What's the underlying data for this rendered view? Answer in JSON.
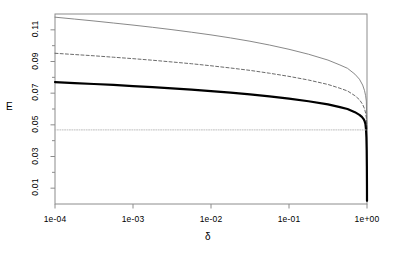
{
  "chart_data": {
    "type": "line",
    "title": "",
    "xlabel": "δ",
    "ylabel": "E",
    "xscale": "log",
    "xlim": [
      0.0001,
      1.0
    ],
    "ylim": [
      0.0,
      0.12
    ],
    "grid": false,
    "legend": "none",
    "xticks": [
      {
        "value": 0.0001,
        "label": "1e-04"
      },
      {
        "value": 0.001,
        "label": "1e-03"
      },
      {
        "value": 0.01,
        "label": "1e-02"
      },
      {
        "value": 0.1,
        "label": "1e-01"
      },
      {
        "value": 1.0,
        "label": "1e+00"
      }
    ],
    "yticks": [
      {
        "value": 0.01,
        "label": "0.01"
      },
      {
        "value": 0.03,
        "label": "0.03"
      },
      {
        "value": 0.05,
        "label": "0.05"
      },
      {
        "value": 0.07,
        "label": "0.07"
      },
      {
        "value": 0.09,
        "label": "0.09"
      },
      {
        "value": 0.11,
        "label": "0.11"
      }
    ],
    "yminorticks": [
      0.02,
      0.04,
      0.06,
      0.08,
      0.1
    ],
    "series": [
      {
        "name": "upper-thin-solid",
        "style": "solid",
        "color": "#7a7a7a",
        "width": 0.9,
        "x": [
          0.0001,
          0.000178,
          0.000316,
          0.000562,
          0.001,
          0.00178,
          0.00316,
          0.00562,
          0.01,
          0.0178,
          0.0316,
          0.0562,
          0.1,
          0.178,
          0.316,
          0.45,
          0.562,
          0.7,
          0.8,
          0.88,
          0.93,
          0.96,
          0.98,
          1.0
        ],
        "y": [
          0.118,
          0.1168,
          0.1156,
          0.1143,
          0.113,
          0.1116,
          0.1101,
          0.1085,
          0.1068,
          0.1049,
          0.1028,
          0.1004,
          0.0977,
          0.0946,
          0.0909,
          0.0878,
          0.0857,
          0.082,
          0.0788,
          0.0751,
          0.0716,
          0.0684,
          0.065,
          0.047
        ]
      },
      {
        "name": "middle-dashed",
        "style": "dashed",
        "color": "#5a5a5a",
        "width": 0.9,
        "x": [
          0.0001,
          0.000178,
          0.000316,
          0.000562,
          0.001,
          0.00178,
          0.00316,
          0.00562,
          0.01,
          0.0178,
          0.0316,
          0.0562,
          0.1,
          0.178,
          0.316,
          0.45,
          0.562,
          0.7,
          0.8,
          0.88,
          0.93,
          0.96,
          0.98,
          1.0
        ],
        "y": [
          0.0952,
          0.0944,
          0.0936,
          0.0927,
          0.0918,
          0.0908,
          0.0897,
          0.0886,
          0.0873,
          0.0859,
          0.0844,
          0.0826,
          0.0806,
          0.0783,
          0.0755,
          0.0731,
          0.0714,
          0.0684,
          0.0659,
          0.0629,
          0.0601,
          0.0574,
          0.0545,
          0.047
        ]
      },
      {
        "name": "lower-thick-solid",
        "style": "solid",
        "color": "#000000",
        "width": 2.2,
        "x": [
          0.0001,
          0.000178,
          0.000316,
          0.000562,
          0.001,
          0.00178,
          0.00316,
          0.00562,
          0.01,
          0.0178,
          0.0316,
          0.0562,
          0.1,
          0.178,
          0.316,
          0.45,
          0.562,
          0.7,
          0.8,
          0.86,
          0.9,
          0.93,
          0.955,
          0.972,
          0.983,
          0.991,
          0.996,
          0.999,
          1.0
        ],
        "y": [
          0.077,
          0.0764,
          0.0758,
          0.0752,
          0.0745,
          0.0738,
          0.073,
          0.0722,
          0.0713,
          0.0703,
          0.0692,
          0.068,
          0.0665,
          0.0649,
          0.0629,
          0.0612,
          0.06,
          0.058,
          0.0563,
          0.055,
          0.0538,
          0.0525,
          0.0505,
          0.047,
          0.042,
          0.034,
          0.024,
          0.011,
          0.002
        ]
      },
      {
        "name": "baseline-dotted-horizontal",
        "style": "dotted",
        "color": "#b5b5b5",
        "width": 0.9,
        "x": [
          0.0001,
          1.0
        ],
        "y": [
          0.0468,
          0.0468
        ]
      }
    ]
  },
  "axes": {
    "ylabel_text": "E",
    "xlabel_text": "δ"
  }
}
